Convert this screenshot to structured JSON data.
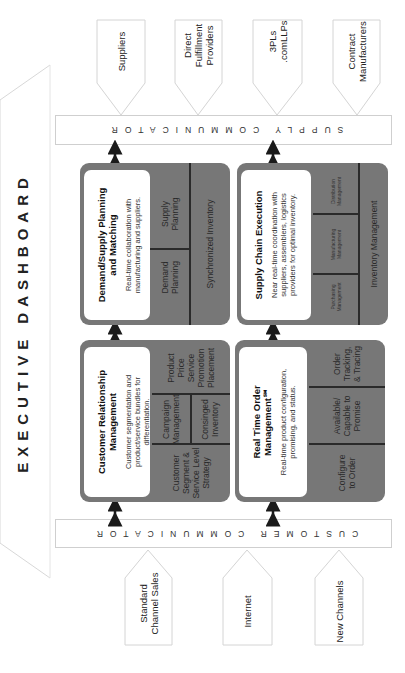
{
  "title": "EXECUTIVE DASHBOARD",
  "supply_communicator": "SUPPLY COMMUNICATOR",
  "customer_communicator": "CUSTOMER COMMUNICATOR",
  "supply_partners": [
    {
      "label": "Suppliers"
    },
    {
      "label": "Direct Fulfillment Providers"
    },
    {
      "label": "3PLs .comLLPs"
    },
    {
      "label": "Contract Manufacturers"
    }
  ],
  "customer_channels": [
    {
      "label": "Standard Channel Sales"
    },
    {
      "label": "Internet"
    },
    {
      "label": "New Channels"
    }
  ],
  "panels": {
    "demand_supply": {
      "title": "Demand/Supply Planning and Matching",
      "description": "Real-time collaboration with manufacturing and suppliers.",
      "cells": [
        "Demand Planning",
        "Supply Planning",
        "Synchronized Inventory"
      ]
    },
    "supply_chain_execution": {
      "title": "Supply Chain Execution",
      "description": "Near real-time coordination with suppliers, assemblers, logistics providers for optimal inventory.",
      "cells": [
        "Purchasing Management",
        "Manufacturing Management",
        "Distribution Management",
        "Inventory Management"
      ]
    },
    "crm": {
      "title": "Customer Relationship Management",
      "description": "Customer segmentation and product/service bundles for differentiation.",
      "cells": [
        "Customer Segment & Service Level Strategy",
        "Campaign Management",
        "Consinged Inventory",
        "Product Price Service Promotion Placement"
      ]
    },
    "rtom": {
      "title": "Real Time Order Management℠",
      "description": "Real-time product configuration, promising, and status.",
      "cells": [
        "Configure to Order",
        "Available/ Capable to Promise",
        "Order Tracking, & Tracing"
      ]
    }
  },
  "colors": {
    "panel_bg": "#777777",
    "card_bg": "#ffffff",
    "outline": "#cfcfcf",
    "text": "#1a1a1a"
  }
}
